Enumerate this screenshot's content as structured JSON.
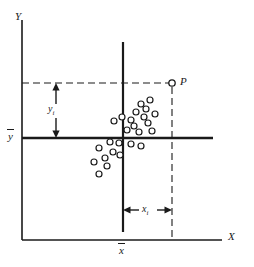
{
  "figure": {
    "title": "",
    "background_color": "#ffffff",
    "stroke_color": "#1a1a1a",
    "width": 254,
    "height": 267
  },
  "labels": {
    "y_axis": "Y",
    "x_axis": "X",
    "y_mean": "y",
    "x_mean": "x",
    "point_p": "P",
    "y_deviation": "y",
    "y_deviation_sub": "i",
    "x_deviation": "x",
    "x_deviation_sub": "i"
  },
  "chart_data": {
    "type": "scatter",
    "title": "",
    "xlabel": "X",
    "ylabel": "Y",
    "xlim": [
      0,
      254
    ],
    "ylim": [
      0,
      267
    ],
    "grid": false,
    "legend": null,
    "annotations": [
      {
        "name": "y-mean-line",
        "kind": "horizontal-line",
        "label": "y",
        "y": 138,
        "x_start": 22,
        "x_end": 213
      },
      {
        "name": "x-mean-line",
        "kind": "vertical-line",
        "label": "x",
        "x": 123,
        "y_start": 42,
        "y_end": 232
      },
      {
        "name": "p-horizontal-dashed",
        "kind": "dashed-horizontal",
        "y": 83,
        "x_start": 22,
        "x_end": 170
      },
      {
        "name": "p-vertical-dashed",
        "kind": "dashed-vertical",
        "x": 172,
        "y_start": 86,
        "y_end": 240
      },
      {
        "name": "y-deviation-arrow",
        "kind": "double-arrow-vertical",
        "x": 56,
        "y_start": 83,
        "y_end": 138,
        "label": "y_i"
      },
      {
        "name": "x-deviation-arrow",
        "kind": "double-arrow-horizontal",
        "y": 210,
        "x_start": 123,
        "x_end": 172,
        "label": "x_i"
      }
    ],
    "highlight_point": {
      "name": "P",
      "x": 172,
      "y": 83,
      "label": "P"
    },
    "points": [
      {
        "x": 114,
        "y": 121
      },
      {
        "x": 122,
        "y": 117
      },
      {
        "x": 131,
        "y": 120
      },
      {
        "x": 136,
        "y": 112
      },
      {
        "x": 141,
        "y": 104
      },
      {
        "x": 146,
        "y": 109
      },
      {
        "x": 150,
        "y": 100
      },
      {
        "x": 144,
        "y": 117
      },
      {
        "x": 134,
        "y": 126
      },
      {
        "x": 127,
        "y": 130
      },
      {
        "x": 139,
        "y": 132
      },
      {
        "x": 148,
        "y": 123
      },
      {
        "x": 155,
        "y": 114
      },
      {
        "x": 152,
        "y": 131
      },
      {
        "x": 131,
        "y": 144
      },
      {
        "x": 141,
        "y": 146
      },
      {
        "x": 119,
        "y": 143
      },
      {
        "x": 110,
        "y": 142
      },
      {
        "x": 99,
        "y": 148
      },
      {
        "x": 113,
        "y": 152
      },
      {
        "x": 120,
        "y": 155
      },
      {
        "x": 105,
        "y": 158
      },
      {
        "x": 94,
        "y": 162
      },
      {
        "x": 107,
        "y": 166
      },
      {
        "x": 99,
        "y": 174
      }
    ],
    "marker": {
      "shape": "circle",
      "filled": false,
      "radius": 3,
      "stroke": "#1a1a1a"
    }
  }
}
